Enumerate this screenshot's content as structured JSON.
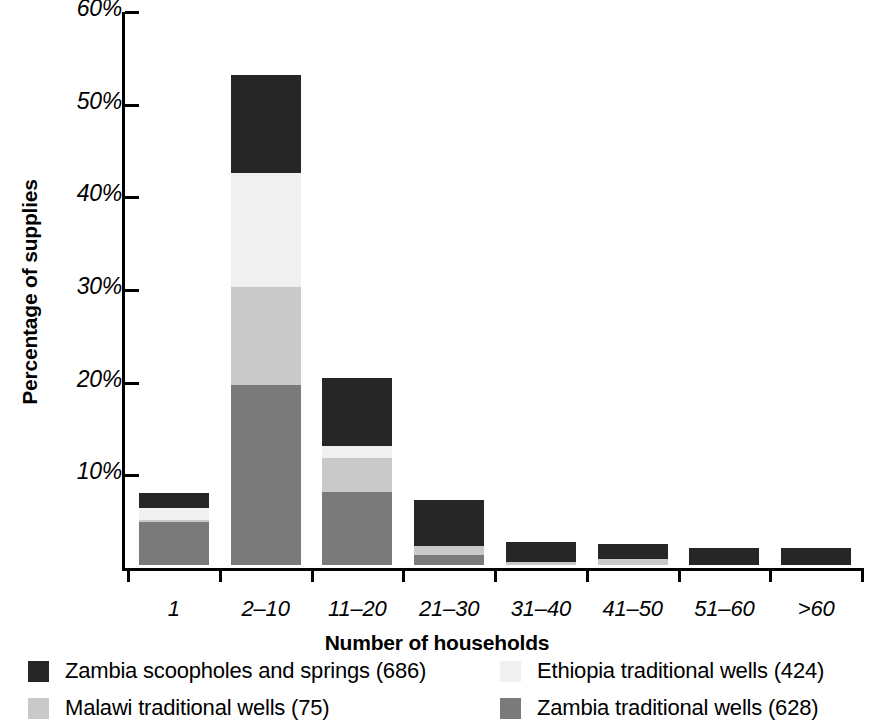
{
  "chart_data": {
    "type": "bar",
    "subtype": "stacked-bar",
    "title": "",
    "xlabel": "Number of households",
    "ylabel": "Percentage of supplies",
    "categories": [
      "1",
      "2–10",
      "11–20",
      "21–30",
      "31–40",
      "41–50",
      "51–60",
      ">60"
    ],
    "ylim": [
      0,
      60
    ],
    "ytick_values": [
      0,
      10,
      20,
      30,
      40,
      50,
      60
    ],
    "ytick_labels": [
      "",
      "10%",
      "20%",
      "30%",
      "40%",
      "50%",
      "60%"
    ],
    "y_unit": "%",
    "grid": false,
    "legend_position": "below-axes",
    "stack_order_bottom_to_top": [
      "Zambia traditional wells (628)",
      "Malawi traditional wells (75)",
      "Ethiopia traditional wells (424)",
      "Zambia scoopholes and springs (686)"
    ],
    "series": [
      {
        "name": "Zambia scoopholes and springs (686)",
        "color": "#262626",
        "values": [
          1.6,
          10.6,
          7.4,
          4.9,
          2.2,
          1.6,
          1.8,
          1.8
        ]
      },
      {
        "name": "Ethiopia traditional wells (424)",
        "color": "#f0f0f0",
        "values": [
          1.3,
          12.3,
          1.3,
          0.0,
          0.0,
          0.0,
          0.0,
          0.0
        ]
      },
      {
        "name": "Malawi traditional wells (75)",
        "color": "#c9c9c9",
        "values": [
          0.3,
          10.6,
          3.6,
          1.0,
          0.3,
          0.7,
          0.0,
          0.0
        ]
      },
      {
        "name": "Zambia traditional wells (628)",
        "color": "#7a7a7a",
        "values": [
          4.6,
          19.4,
          7.9,
          1.1,
          0.0,
          0.0,
          0.0,
          0.0
        ]
      }
    ],
    "totals": [
      7.8,
      52.9,
      20.2,
      7.0,
      2.5,
      2.3,
      1.8,
      1.8
    ]
  },
  "axes": {
    "y_title": "Percentage of supplies",
    "x_title": "Number of households",
    "y_ticks": [
      {
        "label": "60%",
        "value": 60
      },
      {
        "label": "50%",
        "value": 50
      },
      {
        "label": "40%",
        "value": 40
      },
      {
        "label": "30%",
        "value": 30
      },
      {
        "label": "20%",
        "value": 20
      },
      {
        "label": "10%",
        "value": 10
      }
    ],
    "x_ticks": [
      "1",
      "2–10",
      "11–20",
      "21–30",
      "31–40",
      "41–50",
      "51–60",
      ">60"
    ]
  },
  "legend": {
    "entries": [
      {
        "label": "Zambia scoopholes and springs (686)",
        "color": "#262626"
      },
      {
        "label": "Ethiopia traditional wells (424)",
        "color": "#f0f0f0"
      },
      {
        "label": "Malawi traditional wells (75)",
        "color": "#c9c9c9"
      },
      {
        "label": "Zambia traditional wells (628)",
        "color": "#7a7a7a"
      }
    ]
  },
  "colors": {
    "zambia_scoopholes": "#262626",
    "ethiopia_traditional": "#f0f0f0",
    "malawi_traditional": "#c9c9c9",
    "zambia_traditional": "#7a7a7a",
    "axis": "#000000",
    "background": "#ffffff"
  }
}
